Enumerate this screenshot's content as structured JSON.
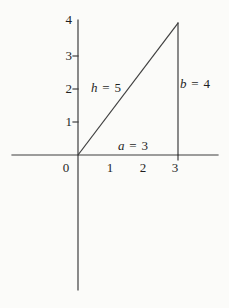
{
  "figure": {
    "background": "#fbfbf9",
    "line_color": "#3f3f3f",
    "text_color": "#1f1f1f",
    "axes": {
      "x_tick_labels": [
        "0",
        "1",
        "2",
        "3"
      ],
      "y_tick_labels": [
        "1",
        "2",
        "3",
        "4"
      ]
    },
    "triangle": {
      "vertices": [
        [
          0,
          0
        ],
        [
          3,
          0
        ],
        [
          3,
          4
        ]
      ],
      "base": 3,
      "height": 4,
      "hypotenuse": 5
    },
    "side_labels": {
      "hypotenuse": {
        "var": "h",
        "eq": "=",
        "val": "5"
      },
      "vertical": {
        "var": "b",
        "eq": "=",
        "val": "4"
      },
      "horizontal": {
        "var": "a",
        "eq": "=",
        "val": "3"
      }
    }
  }
}
